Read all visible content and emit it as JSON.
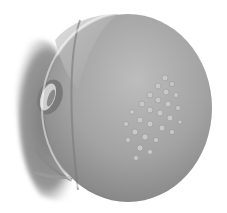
{
  "image": {
    "subject": "illustration-of-head-with-lesion-cluster",
    "style": "grayscale-medical-illustration",
    "background_color": "#ffffff",
    "skin_color_light": "#b4b4b4",
    "skin_color_mid": "#9a9a9a",
    "skin_color_dark": "#6e6e6e",
    "hair_color": "#7d7d7d",
    "lesion_color": "#c6c6c6"
  }
}
